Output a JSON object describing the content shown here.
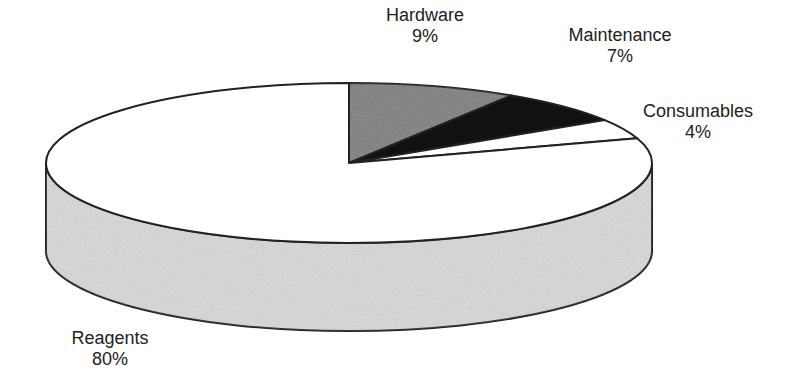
{
  "chart_data": {
    "type": "pie",
    "style": "3d",
    "title": "",
    "categories": [
      "Hardware",
      "Maintenance",
      "Consumables",
      "Reagents"
    ],
    "values": [
      9,
      7,
      4,
      80
    ],
    "units": "%",
    "colors": [
      "#7a7a7a",
      "#111111",
      "#ffffff",
      "#d9d9d9"
    ],
    "legend": "none",
    "labels": [
      {
        "name": "Hardware",
        "pct": "9%"
      },
      {
        "name": "Maintenance",
        "pct": "7%"
      },
      {
        "name": "Consumables",
        "pct": "4%"
      },
      {
        "name": "Reagents",
        "pct": "80%"
      }
    ]
  }
}
